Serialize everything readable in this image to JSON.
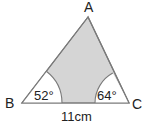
{
  "figure": {
    "type": "triangle",
    "vertices": {
      "A": {
        "label": "A",
        "x": 88,
        "y": 17
      },
      "B": {
        "label": "B",
        "x": 22,
        "y": 103
      },
      "C": {
        "label": "C",
        "x": 129,
        "y": 103
      }
    },
    "angles": {
      "B": {
        "label": "52°",
        "value": 52
      },
      "C": {
        "label": "64°",
        "value": 64
      }
    },
    "sides": {
      "BC": {
        "label": "11cm",
        "length": 11,
        "unit": "cm"
      }
    },
    "colors": {
      "shaded_region": "#d5d5d5",
      "outline": "#7a7a7a",
      "angle_sector": "#ffffff",
      "text": "#222222"
    }
  }
}
